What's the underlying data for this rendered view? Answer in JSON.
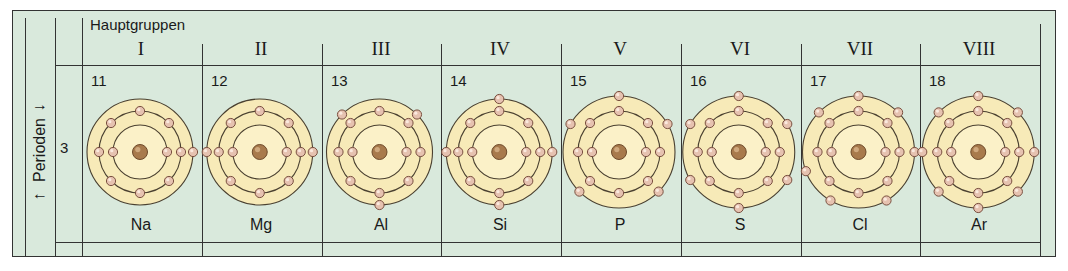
{
  "header": {
    "title": "Hauptgruppen"
  },
  "period_axis": {
    "label": "Perioden",
    "period": "3"
  },
  "groups": [
    {
      "roman": "I",
      "z": "11",
      "symbol": "Na",
      "shells": [
        2,
        8,
        1
      ],
      "outer_angles": [
        90
      ]
    },
    {
      "roman": "II",
      "z": "12",
      "symbol": "Mg",
      "shells": [
        2,
        8,
        2
      ],
      "outer_angles": [
        90,
        270
      ]
    },
    {
      "roman": "III",
      "z": "13",
      "symbol": "Al",
      "shells": [
        2,
        8,
        3
      ],
      "outer_angles": [
        45,
        180,
        315
      ]
    },
    {
      "roman": "IV",
      "z": "14",
      "symbol": "Si",
      "shells": [
        2,
        8,
        4
      ],
      "outer_angles": [
        0,
        90,
        180,
        270
      ]
    },
    {
      "roman": "V",
      "z": "15",
      "symbol": "P",
      "shells": [
        2,
        8,
        5
      ],
      "outer_angles": [
        0,
        60,
        135,
        225,
        300
      ]
    },
    {
      "roman": "VI",
      "z": "16",
      "symbol": "S",
      "shells": [
        2,
        8,
        6
      ],
      "outer_angles": [
        0,
        60,
        120,
        180,
        240,
        300
      ]
    },
    {
      "roman": "VII",
      "z": "17",
      "symbol": "Cl",
      "shells": [
        2,
        8,
        7
      ],
      "outer_angles": [
        0,
        45,
        90,
        150,
        210,
        250,
        315
      ]
    },
    {
      "roman": "VIII",
      "z": "18",
      "symbol": "Ar",
      "shells": [
        2,
        8,
        8
      ],
      "outer_angles": [
        0,
        45,
        90,
        135,
        180,
        225,
        270,
        315
      ]
    }
  ],
  "colors": {
    "background": "#d9e9dc",
    "atom_fill": "#f7eab8",
    "atom_inner_fill": "#fbf1c8",
    "shell_stroke": "#4a4030",
    "electron": "#e6c2b0",
    "electron_stroke": "#7a5040",
    "nucleus": "#a87a4c",
    "line": "#333333"
  }
}
